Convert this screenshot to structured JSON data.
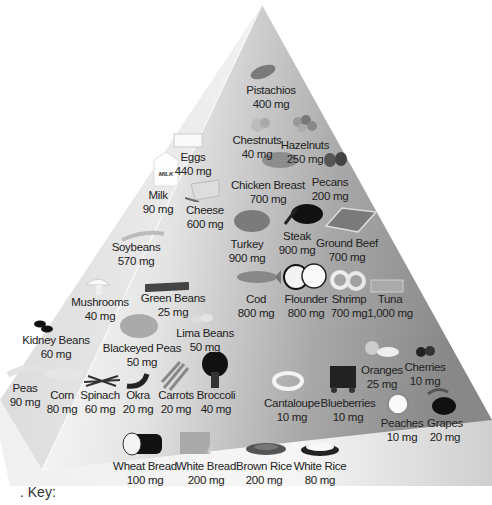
{
  "diagram": {
    "type": "food pyramid",
    "key_label": ". Key:",
    "colors": {
      "left_face": "#e6e6e6",
      "front_face_light": "#f4f4f4",
      "front_face_dark": "#8a8a8a",
      "right_shadow": "#7a7a7a",
      "text": "#222222"
    }
  },
  "items": [
    {
      "name": "Pistachios",
      "value": "400 mg"
    },
    {
      "name": "Chestnuts",
      "value": "40 mg"
    },
    {
      "name": "Hazelnuts",
      "value": "250 mg"
    },
    {
      "name": "Eggs",
      "value": "440 mg"
    },
    {
      "name": "Chicken Breast",
      "value": "700 mg"
    },
    {
      "name": "Pecans",
      "value": "200 mg"
    },
    {
      "name": "Milk",
      "value": "90 mg"
    },
    {
      "name": "Cheese",
      "value": "600 mg"
    },
    {
      "name": "Turkey",
      "value": "900 mg"
    },
    {
      "name": "Steak",
      "value": "900 mg"
    },
    {
      "name": "Ground Beef",
      "value": "700 mg"
    },
    {
      "name": "Soybeans",
      "value": "570 mg"
    },
    {
      "name": "Cod",
      "value": "800 mg"
    },
    {
      "name": "Flounder",
      "value": "800 mg"
    },
    {
      "name": "Shrimp",
      "value": "700 mg"
    },
    {
      "name": "Tuna",
      "value": "1,000 mg"
    },
    {
      "name": "Mushrooms",
      "value": "40 mg"
    },
    {
      "name": "Green Beans",
      "value": "25 mg"
    },
    {
      "name": "Kidney Beans",
      "value": "60 mg"
    },
    {
      "name": "Blackeyed Peas",
      "value": "50 mg"
    },
    {
      "name": "Lima Beans",
      "value": "50 mg"
    },
    {
      "name": "Peas",
      "value": "90 mg"
    },
    {
      "name": "Corn",
      "value": "80 mg"
    },
    {
      "name": "Spinach",
      "value": "60 mg"
    },
    {
      "name": "Okra",
      "value": "20 mg"
    },
    {
      "name": "Carrots",
      "value": "20 mg"
    },
    {
      "name": "Broccoli",
      "value": "40 mg"
    },
    {
      "name": "Oranges",
      "value": "25 mg"
    },
    {
      "name": "Cherries",
      "value": "10 mg"
    },
    {
      "name": "Cantaloupe",
      "value": "10 mg"
    },
    {
      "name": "Blueberries",
      "value": "10 mg"
    },
    {
      "name": "Peaches",
      "value": "10 mg"
    },
    {
      "name": "Grapes",
      "value": "20 mg"
    },
    {
      "name": "Wheat Bread",
      "value": "100 mg"
    },
    {
      "name": "White Bread",
      "value": "200 mg"
    },
    {
      "name": "Brown Rice",
      "value": "200 mg"
    },
    {
      "name": "White Rice",
      "value": "80 mg"
    }
  ],
  "milk_carton_text": "MILK"
}
